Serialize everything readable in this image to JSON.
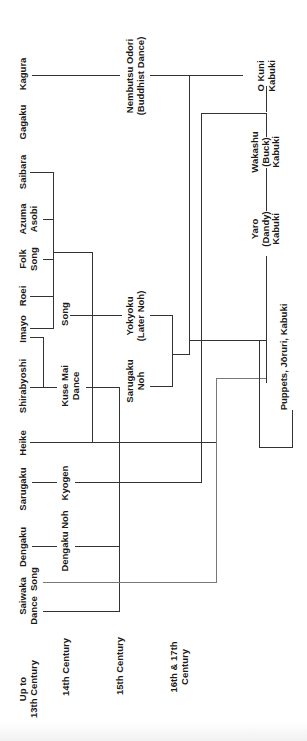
{
  "eras": [
    {
      "id": "era-13",
      "label": "Up to\n13th Century"
    },
    {
      "id": "era-14",
      "label": "14th Century"
    },
    {
      "id": "era-15",
      "label": "15th Century"
    },
    {
      "id": "era-16-17",
      "label": "16th & 17th\nCentury"
    }
  ],
  "nodes": {
    "kagura": "Kagura",
    "gagaku": "Gagaku",
    "saibara": "Saibara",
    "azuma_asobi": "Azuma\nAsobi",
    "folk_song": "Folk\nSong",
    "roei": "Roei",
    "imayo": "Imayo",
    "shirabyoshi": "Shirabyoshi",
    "heike": "Heike",
    "sarugaku": "Sarugaku",
    "dengaku": "Dengaku",
    "saiwaka": "Saiwaka\nDance  Song",
    "song": "Song",
    "kuse_mai": "Kuse Mai\nDance",
    "kyogen": "Kyogen",
    "dengaku_noh": "Dengaku Noh",
    "yokyoku": "Yokyoku\n(Later Noh)",
    "sarugaku_noh": "Sarugaku\nNoh",
    "nembutsu": "Nembutsu Odori\n(Buddhist Dance)",
    "okuni": "O Kuni\nKabuki",
    "wakashu": "Wakashu\n(Buck)\nKabuki",
    "yaro": "Yaro\n(Dandy)\nKabuki",
    "puppets": "Puppets, Jōruri, Kabuki"
  }
}
